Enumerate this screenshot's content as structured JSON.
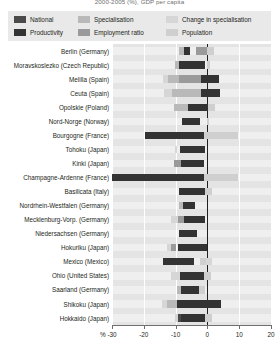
{
  "chart_title": "2000-2005 (%), GDP per capita",
  "legend": {
    "items": [
      {
        "label": "National",
        "color": "#4a4a4a",
        "row": 1,
        "col": 1
      },
      {
        "label": "Specialisation",
        "color": "#b9b9b9",
        "row": 1,
        "col": 2
      },
      {
        "label": "Change in specialisation",
        "color": "#d6d6d6",
        "row": 1,
        "col": 3
      },
      {
        "label": "Productivity",
        "color": "#333333",
        "row": 2,
        "col": 1
      },
      {
        "label": "Employment ratio",
        "color": "#9a9a9a",
        "row": 2,
        "col": 2
      },
      {
        "label": "Population",
        "color": "#cfcfcf",
        "row": 2,
        "col": 3
      }
    ]
  },
  "chart_data": {
    "type": "bar",
    "orientation": "horizontal",
    "stacked": true,
    "title": "2000-2005 (%), GDP per capita",
    "xlabel": "%",
    "ylabel": "",
    "xlim": [
      -30,
      20
    ],
    "xticks": [
      -30,
      -20,
      -10,
      0,
      10,
      20
    ],
    "xticklabels": [
      "-30",
      "-20",
      "-10",
      "0",
      "10",
      "20"
    ],
    "grid": true,
    "legend_position": "top",
    "series_names": [
      "National",
      "Productivity",
      "Specialisation",
      "Employment ratio",
      "Change in specialisation",
      "Population"
    ],
    "series_colors": [
      "#4a4a4a",
      "#333333",
      "#b9b9b9",
      "#9a9a9a",
      "#d6d6d6",
      "#cfcfcf"
    ],
    "categories": [
      "Berlin (Germany)",
      "Moravskoslezko (Czech Republic)",
      "Melilla  (Spain)",
      "Ceuta (Spain)",
      "Opolskie (Poland)",
      "Nord-Norge (Norway)",
      "Bourgogne (France)",
      "Tohoku (Japan)",
      "Kinki (Japan)",
      "Champagne-Ardenne (France)",
      "Basilicata (Italy)",
      "Nordrhein-Westfalen (Germany)",
      "Mecklenburg-Vorp. (Germany)",
      "Niedersachsen (Germany)",
      "Hokuriku (Japan)",
      "Mexico (Mexico)",
      "Ohio (United States)",
      "Saarland (Germany)",
      "Shikoku (Japan)",
      "Hokkaido (Japan)"
    ],
    "rows": [
      {
        "category": "Berlin (Germany)",
        "segments": [
          {
            "name": "Specialisation",
            "start": -9.0,
            "end": -7.3
          },
          {
            "name": "Productivity",
            "start": -7.3,
            "end": -5.5
          },
          {
            "name": "Employment ratio",
            "start": -3.6,
            "end": -0.2
          },
          {
            "name": "Population",
            "start": 0.0,
            "end": 2.1
          }
        ]
      },
      {
        "category": "Moravskoslezko (Czech Republic)",
        "segments": [
          {
            "name": "Specialisation",
            "start": -10.2,
            "end": -8.8
          },
          {
            "name": "Productivity",
            "start": -8.8,
            "end": -0.9
          },
          {
            "name": "Population",
            "start": 0.0,
            "end": 0.8
          }
        ]
      },
      {
        "category": "Melilla  (Spain)",
        "segments": [
          {
            "name": "Change in specialisation",
            "start": -14.0,
            "end": -12.4
          },
          {
            "name": "Specialisation",
            "start": -12.4,
            "end": -9.0
          },
          {
            "name": "Employment ratio",
            "start": -9.0,
            "end": -2.0
          },
          {
            "name": "Productivity",
            "start": -2.0,
            "end": 3.7
          }
        ]
      },
      {
        "category": "Ceuta (Spain)",
        "segments": [
          {
            "name": "Change in specialisation",
            "start": -13.5,
            "end": -11.0
          },
          {
            "name": "Specialisation",
            "start": -11.0,
            "end": -2.0
          },
          {
            "name": "Productivity",
            "start": -2.0,
            "end": 4.0
          }
        ]
      },
      {
        "category": "Opolskie (Poland)",
        "segments": [
          {
            "name": "Specialisation",
            "start": -10.6,
            "end": -6.2
          },
          {
            "name": "Productivity",
            "start": -6.2,
            "end": 0.3
          },
          {
            "name": "Population",
            "start": 0.3,
            "end": 2.5
          }
        ]
      },
      {
        "category": "Nord-Norge (Norway)",
        "segments": [
          {
            "name": "Productivity",
            "start": -7.9,
            "end": -2.2
          },
          {
            "name": "Population",
            "start": 0.0,
            "end": 0.6
          }
        ]
      },
      {
        "category": "Bourgogne (France)",
        "segments": [
          {
            "name": "Productivity",
            "start": -19.5,
            "end": -1.0
          },
          {
            "name": "Population",
            "start": -1.0,
            "end": 9.5
          }
        ]
      },
      {
        "category": "Tohoku (Japan)",
        "segments": [
          {
            "name": "Change in specialisation",
            "start": -10.3,
            "end": -9.6
          },
          {
            "name": "Productivity",
            "start": -8.6,
            "end": -0.6
          }
        ]
      },
      {
        "category": "Kinki (Japan)",
        "segments": [
          {
            "name": "Employment ratio",
            "start": -10.4,
            "end": -8.3
          },
          {
            "name": "Productivity",
            "start": -8.3,
            "end": -1.0
          }
        ]
      },
      {
        "category": "Champagne-Ardenne (France)",
        "segments": [
          {
            "name": "Productivity",
            "start": -30.0,
            "end": -1.0
          },
          {
            "name": "Population",
            "start": -1.0,
            "end": 9.5
          }
        ]
      },
      {
        "category": "Basilicata (Italy)",
        "segments": [
          {
            "name": "Productivity",
            "start": -9.0,
            "end": -0.6
          },
          {
            "name": "Population",
            "start": -0.6,
            "end": 1.3
          }
        ]
      },
      {
        "category": "Nordrhein-Westfalen (Germany)",
        "segments": [
          {
            "name": "Specialisation",
            "start": -9.0,
            "end": -7.6
          },
          {
            "name": "Productivity",
            "start": -7.6,
            "end": -3.9
          }
        ]
      },
      {
        "category": "Mecklenburg-Vorp. (Germany)",
        "segments": [
          {
            "name": "Change in specialisation",
            "start": -11.3,
            "end": -9.3
          },
          {
            "name": "Employment ratio",
            "start": -9.3,
            "end": -7.4
          },
          {
            "name": "Productivity",
            "start": -7.4,
            "end": -0.9
          }
        ]
      },
      {
        "category": "Niedersachsen (Germany)",
        "segments": [
          {
            "name": "Productivity",
            "start": -9.0,
            "end": -3.3
          }
        ]
      },
      {
        "category": "Hokuriku (Japan)",
        "segments": [
          {
            "name": "Change in specialisation",
            "start": -12.6,
            "end": -11.3
          },
          {
            "name": "Employment ratio",
            "start": -11.3,
            "end": -10.0
          },
          {
            "name": "Productivity",
            "start": -9.3,
            "end": -0.2
          }
        ]
      },
      {
        "category": "Mexico (Mexico)",
        "segments": [
          {
            "name": "Productivity",
            "start": -14.0,
            "end": -4.2
          },
          {
            "name": "Population",
            "start": -2.2,
            "end": -0.3
          },
          {
            "name": "Change in specialisation",
            "start": -0.3,
            "end": 1.3
          }
        ]
      },
      {
        "category": "Ohio (United States)",
        "segments": [
          {
            "name": "Change in specialisation",
            "start": -11.3,
            "end": -8.6
          },
          {
            "name": "Productivity",
            "start": -8.6,
            "end": -1.0
          },
          {
            "name": "Population",
            "start": -1.0,
            "end": 1.2
          }
        ]
      },
      {
        "category": "Saarland (Germany)",
        "segments": [
          {
            "name": "Specialisation",
            "start": -9.6,
            "end": -8.3
          },
          {
            "name": "Productivity",
            "start": -8.3,
            "end": -2.6
          },
          {
            "name": "Population",
            "start": -2.6,
            "end": -0.9
          }
        ]
      },
      {
        "category": "Shikoku (Japan)",
        "segments": [
          {
            "name": "Change in specialisation",
            "start": -14.3,
            "end": -12.6
          },
          {
            "name": "Specialisation",
            "start": -12.6,
            "end": -9.6
          },
          {
            "name": "Productivity",
            "start": -9.6,
            "end": 4.3
          }
        ]
      },
      {
        "category": "Hokkaido (Japan)",
        "segments": [
          {
            "name": "Change in specialisation",
            "start": -10.3,
            "end": -9.3
          },
          {
            "name": "National",
            "start": -9.3,
            "end": -8.3
          },
          {
            "name": "Productivity",
            "start": -8.3,
            "end": -0.6
          },
          {
            "name": "Population",
            "start": -0.6,
            "end": 1.6
          }
        ]
      }
    ]
  }
}
